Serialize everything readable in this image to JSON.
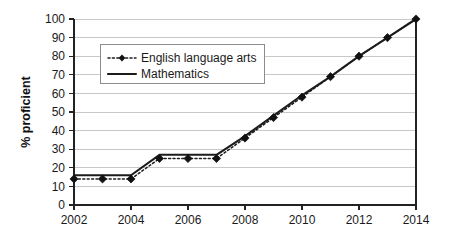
{
  "chart_data": {
    "type": "line",
    "title": "",
    "subtitle": "",
    "xlabel": "",
    "ylabel": "% proficient",
    "xlim": [
      2002,
      2014
    ],
    "ylim": [
      0,
      100
    ],
    "grid": "horizontal",
    "legend_position": "top-left-inside",
    "x": [
      2002,
      2003,
      2004,
      2005,
      2006,
      2007,
      2008,
      2009,
      2010,
      2011,
      2012,
      2013,
      2014
    ],
    "x_tick_labels": [
      "2002",
      "2004",
      "2006",
      "2008",
      "2010",
      "2012",
      "2014"
    ],
    "x_tick_values": [
      2002,
      2004,
      2006,
      2008,
      2010,
      2012,
      2014
    ],
    "y_tick_labels": [
      "0",
      "10",
      "20",
      "30",
      "40",
      "50",
      "60",
      "70",
      "80",
      "90",
      "100"
    ],
    "y_tick_values": [
      0,
      10,
      20,
      30,
      40,
      50,
      60,
      70,
      80,
      90,
      100
    ],
    "series": [
      {
        "name": "English language arts",
        "style": "dotted-with-diamond-markers",
        "color": "#1c1c1c",
        "values": [
          14,
          14,
          14,
          25,
          25,
          25,
          36,
          47,
          58,
          69,
          80,
          90,
          100
        ]
      },
      {
        "name": "Mathematics",
        "style": "solid-line",
        "color": "#1c1c1c",
        "values": [
          16,
          16,
          16,
          27,
          27,
          27,
          37,
          48,
          59,
          69,
          80,
          90,
          100
        ]
      }
    ]
  },
  "legend": {
    "entries": [
      {
        "label": "English language arts"
      },
      {
        "label": "Mathematics"
      }
    ]
  },
  "axes": {
    "y_axis_title": "% proficient"
  }
}
